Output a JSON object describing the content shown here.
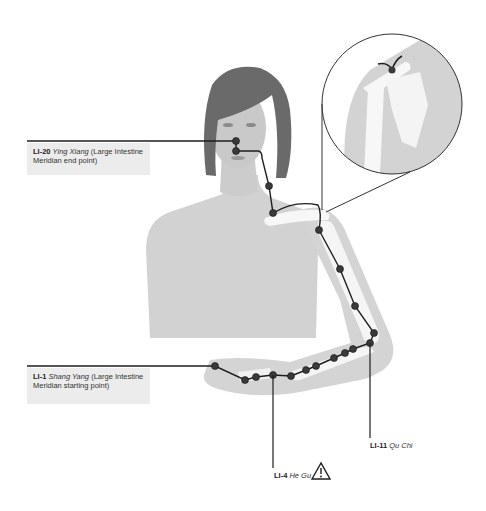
{
  "diagram": {
    "title": "Large Intestine Meridian",
    "colors": {
      "skin": "#cfcfcf",
      "skin_light": "#dcdcdc",
      "hair": "#6a6a6a",
      "bone": "#f7f7f7",
      "line": "#1e1e1e",
      "point": "#3a3a3a",
      "label_bg": "#ececec"
    },
    "labels": [
      {
        "id": "LI-20",
        "code": "LI-20",
        "name": "Ying Xiang",
        "desc": "(Large Intestine Meridian end point)"
      },
      {
        "id": "LI-1",
        "code": "LI-1",
        "name": "Shang Yang",
        "desc": "(Large Intestine Meridian starting point)"
      },
      {
        "id": "LI-4",
        "code": "LI-4",
        "name": "He Gu",
        "warning": "warning-triangle-icon"
      },
      {
        "id": "LI-11",
        "code": "LI-11",
        "name": "Qu Chi"
      }
    ],
    "inset": {
      "description": "Shoulder joint detail (point LI-15)"
    }
  }
}
